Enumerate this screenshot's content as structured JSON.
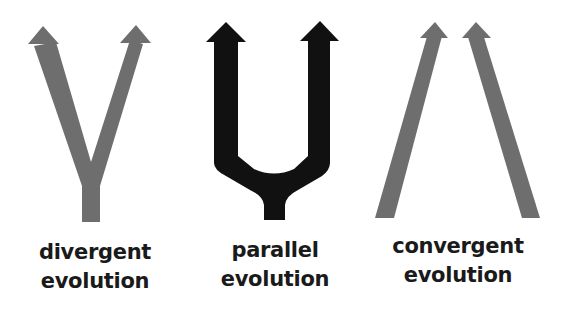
{
  "colors": {
    "gray_arrow": "#6e6e6e",
    "black_arrow": "#111111",
    "text": "#1a1a1a",
    "background": "#ffffff"
  },
  "panels": [
    {
      "id": "divergent",
      "line1": "divergent",
      "line2": "evolution",
      "arrow_color": "gray"
    },
    {
      "id": "parallel",
      "line1": "parallel",
      "line2": "evolution",
      "arrow_color": "black"
    },
    {
      "id": "convergent",
      "line1": "convergent",
      "line2": "evolution",
      "arrow_color": "gray"
    }
  ]
}
